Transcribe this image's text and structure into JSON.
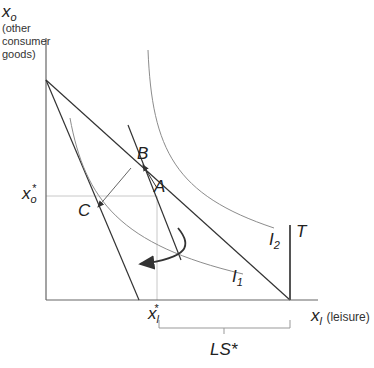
{
  "diagram": {
    "y_axis": {
      "symbol": "x",
      "subscript": "o",
      "description": "(other consumer goods)",
      "desc_lines": [
        "(other",
        "consumer",
        "goods)"
      ]
    },
    "x_axis": {
      "symbol": "x",
      "subscript": "l",
      "description": "(leisure)"
    },
    "x_o_star": {
      "symbol": "x",
      "subscript": "o",
      "sup": "*"
    },
    "x_l_star": {
      "symbol": "x",
      "subscript": "l",
      "sup": "*"
    },
    "points": {
      "A": "A",
      "B": "B",
      "C": "C"
    },
    "curves": {
      "I1": {
        "symbol": "I",
        "subscript": "1"
      },
      "I2": {
        "symbol": "I",
        "subscript": "2"
      }
    },
    "T": "T",
    "LS": "LS*",
    "colors": {
      "line": "#333333",
      "curve": "#8c8c8c",
      "guide": "#c8c8c8"
    }
  }
}
